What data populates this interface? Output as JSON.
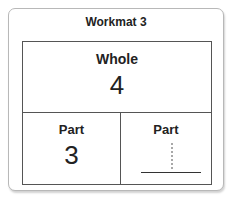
{
  "title": "Workmat 3",
  "whole": {
    "label": "Whole",
    "value": "4"
  },
  "parts": [
    {
      "label": "Part",
      "value": "3"
    },
    {
      "label": "Part",
      "value": "",
      "trace_hint": "1"
    }
  ],
  "colors": {
    "border": "#555555",
    "card_border": "#b8b8b8",
    "trace": "#a8a8a8"
  }
}
